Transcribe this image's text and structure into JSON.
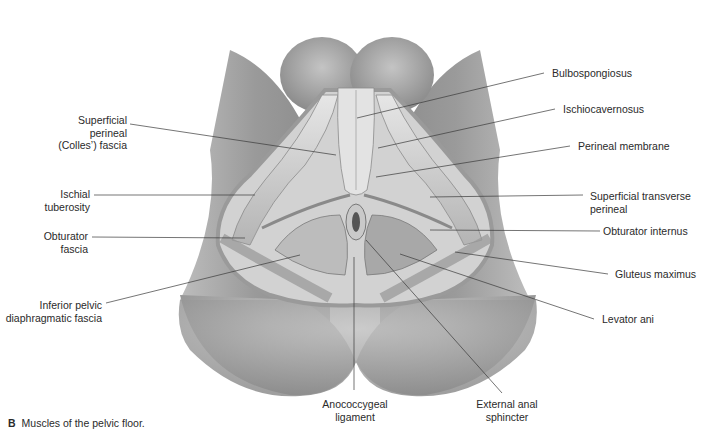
{
  "figure": {
    "caption_letter": "B",
    "caption_text": "Muscles of the pelvic floor."
  },
  "labels_left": [
    {
      "id": "superficial-perineal-fascia",
      "text": "Superficial\nperineal\n(Colles’) fascia"
    },
    {
      "id": "ischial-tuberosity",
      "text": "Ischial\ntuberosity"
    },
    {
      "id": "obturator-fascia",
      "text": "Obturator\nfascia"
    },
    {
      "id": "inferior-pelvic-diaphragmatic-fascia",
      "text": "Inferior pelvic\ndiaphragmatic fascia"
    }
  ],
  "labels_right": [
    {
      "id": "bulbospongiosus",
      "text": "Bulbospongiosus"
    },
    {
      "id": "ischiocavernosus",
      "text": "Ischiocavernosus"
    },
    {
      "id": "perineal-membrane",
      "text": "Perineal membrane"
    },
    {
      "id": "superficial-transverse-perineal",
      "text": "Superficial transverse\nperineal"
    },
    {
      "id": "obturator-internus",
      "text": "Obturator internus"
    },
    {
      "id": "gluteus-maximus",
      "text": "Gluteus maximus"
    },
    {
      "id": "levator-ani",
      "text": "Levator ani"
    }
  ],
  "labels_bottom": [
    {
      "id": "anococcygeal-ligament",
      "text": "Anococcygeal\nligament"
    },
    {
      "id": "external-anal-sphincter",
      "text": "External anal\nsphincter"
    }
  ],
  "colors": {
    "skin_dark": "#8c8c8c",
    "skin_mid": "#a9a9a9",
    "skin_light": "#c8c8c8",
    "muscle_light": "#dedede",
    "muscle_mid": "#bdbdbd",
    "muscle_dark": "#6e6e6e",
    "leader_line": "#3a3a3a",
    "text": "#2a2a2a"
  }
}
